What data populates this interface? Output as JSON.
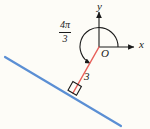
{
  "figure": {
    "background_color": "#fdfcf7"
  },
  "axes": {
    "x_label": "x",
    "y_label": "y",
    "origin_label": "O",
    "color": "#1a1a1a",
    "origin_px": [
      99,
      47
    ],
    "x_axis_end_px": [
      137,
      47
    ],
    "y_axis_end_px": [
      99,
      9
    ]
  },
  "angle": {
    "numerator": "4π",
    "denominator": "3",
    "value_radians": "4π/3",
    "degrees": 240,
    "direction": "counterclockwise",
    "arc_radius_px": 19,
    "arc_color": "#1a1a1a"
  },
  "terminal_ray": {
    "label": "3",
    "length": 3,
    "color": "#e8605a",
    "start_px": [
      99,
      47
    ],
    "end_px": [
      73,
      93
    ]
  },
  "line": {
    "name": "tangent-line",
    "color": "#5b8fd4",
    "start_px": [
      5,
      57
    ],
    "end_px": [
      121,
      126
    ]
  },
  "right_angle": {
    "marker": "square",
    "color": "#1a1a1a",
    "vertex_px": [
      73,
      93
    ],
    "size_px": 9
  }
}
